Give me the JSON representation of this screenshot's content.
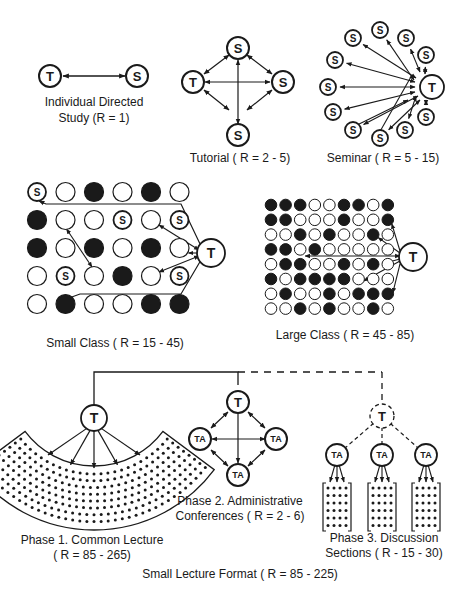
{
  "figure": {
    "colors": {
      "ink": "#1a1a1a",
      "background": "#ffffff"
    },
    "node_labels": {
      "teacher": "T",
      "student": "S",
      "assistant": "TA"
    },
    "sections": {
      "individual": {
        "title_line1": "Individual Directed",
        "title_line2": "Study (R = 1)",
        "range": "1"
      },
      "tutorial": {
        "title": "Tutorial ( R = 2 - 5)",
        "range": "2 - 5",
        "students": 3
      },
      "seminar": {
        "title": "Seminar ( R = 5 - 15)",
        "range": "5 - 15",
        "students": 11
      },
      "small_class": {
        "title": "Small Class ( R = 15 - 45)",
        "range": "15 - 45",
        "grid_legend": "S = participating student, filled = present seat, open = seat",
        "grid": [
          [
            "S",
            "o",
            "x",
            "o",
            "x",
            "o"
          ],
          [
            "x",
            "o",
            "o",
            "S",
            "o",
            "S"
          ],
          [
            "x",
            "o",
            "x",
            "o",
            "x",
            "o"
          ],
          [
            "o",
            "S",
            "o",
            "x",
            "o",
            "S"
          ],
          [
            "o",
            "x",
            "o",
            "o",
            "x",
            "x"
          ]
        ]
      },
      "large_class": {
        "title": "Large Class ( R = 45 - 85)",
        "range": "45 - 85",
        "grid": [
          [
            "x",
            "x",
            "x",
            "o",
            "o",
            "x",
            "x",
            "o",
            "x"
          ],
          [
            "x",
            "x",
            "o",
            "o",
            "o",
            "x",
            "o",
            "o",
            "x"
          ],
          [
            "o",
            "o",
            "x",
            "o",
            "x",
            "o",
            "o",
            "x",
            "o"
          ],
          [
            "x",
            "x",
            "o",
            "x",
            "o",
            "o",
            "o",
            "o",
            "o"
          ],
          [
            "o",
            "x",
            "x",
            "o",
            "o",
            "x",
            "o",
            "x",
            "o"
          ],
          [
            "x",
            "o",
            "x",
            "x",
            "x",
            "x",
            "o",
            "o",
            "o"
          ],
          [
            "o",
            "x",
            "o",
            "o",
            "x",
            "o",
            "x",
            "x",
            "x"
          ],
          [
            "o",
            "o",
            "x",
            "o",
            "x",
            "o",
            "o",
            "x",
            "o"
          ]
        ]
      },
      "phase1": {
        "title_line1": "Phase 1. Common Lecture",
        "title_line2": "( R = 85 - 265)",
        "range": "85 - 265"
      },
      "phase2": {
        "title_line1": "Phase 2. Administrative",
        "title_line2": "Conferences ( R = 2 - 6)",
        "range": "2 - 6",
        "assistants": 3
      },
      "phase3": {
        "title_line1": "Phase 3. Discussion",
        "title_line2": "Sections ( R - 15 - 30)",
        "range": "15 - 30",
        "sections": 3
      },
      "footer": {
        "title": "Small Lecture Format ( R = 85 - 225)",
        "range": "85 - 225"
      }
    }
  }
}
